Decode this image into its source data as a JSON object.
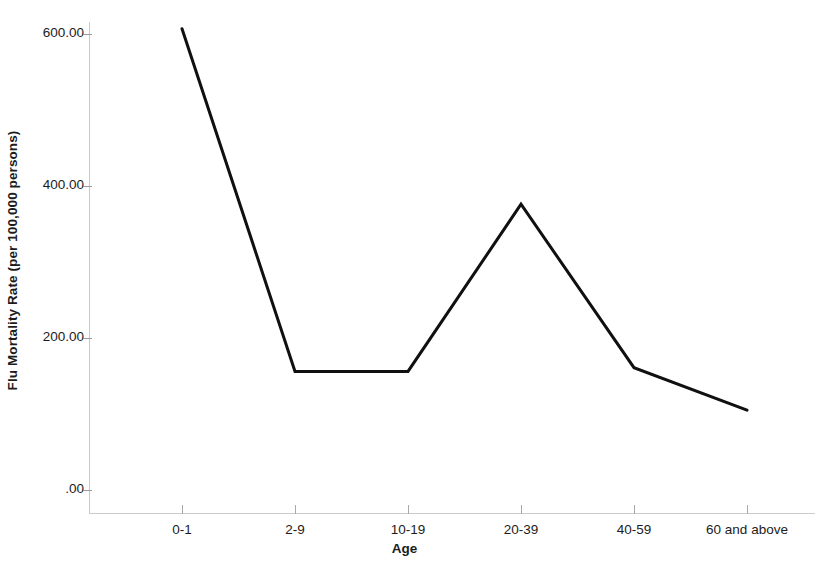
{
  "chart_data": {
    "type": "line",
    "title": "",
    "xlabel": "Age",
    "ylabel": "Flu Mortality Rate (per 100,000 persons)",
    "categories": [
      "0-1",
      "2-9",
      "10-19",
      "20-39",
      "40-59",
      "60 and above"
    ],
    "values": [
      607,
      156,
      156,
      376,
      161,
      105
    ],
    "series": [
      {
        "name": "Flu Mortality Rate",
        "values": [
          607,
          156,
          156,
          376,
          161,
          105
        ]
      }
    ],
    "ylim": [
      0,
      645
    ],
    "y_ticks": [
      0,
      200,
      400,
      600
    ],
    "y_tick_labels": [
      ".00",
      "200.00",
      "400.00",
      "600.00"
    ],
    "grid": false,
    "legend": false,
    "legend_position": "none",
    "line_color": "#101010",
    "line_width": 3,
    "markers": false,
    "background_color": "#ffffff",
    "axis_color": "#c8c8c8"
  },
  "axes": {
    "y_title": "Flu Mortality Rate (per 100,000 persons)",
    "x_title": "Age"
  }
}
